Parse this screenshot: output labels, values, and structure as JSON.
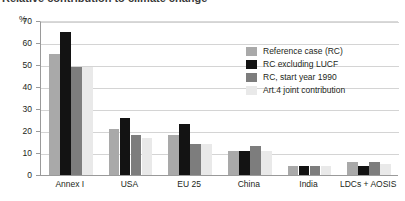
{
  "chart_data": {
    "type": "bar",
    "title": "Relative contribution to climate change",
    "ylabel": "%",
    "xlabel": "",
    "ylim": [
      0,
      70
    ],
    "yticks": [
      0,
      10,
      20,
      30,
      40,
      50,
      60,
      70
    ],
    "grid": true,
    "legend_position": "inside-top-right",
    "categories": [
      "Annex I",
      "USA",
      "EU 25",
      "China",
      "India",
      "LDCs + AOSIS"
    ],
    "series": [
      {
        "name": "Reference case (RC)",
        "color": "#a9a9a9",
        "values": [
          55,
          21,
          18,
          11,
          4,
          6
        ]
      },
      {
        "name": "RC excluding LUCF",
        "color": "#131313",
        "values": [
          65,
          26,
          23,
          11,
          4,
          4
        ]
      },
      {
        "name": "RC, start year 1990",
        "color": "#7d7d7d",
        "values": [
          49,
          18,
          14,
          13,
          4,
          6
        ]
      },
      {
        "name": "Art.4 joint contribution",
        "color": "#e9e9e9",
        "values": [
          49,
          17,
          14,
          11,
          4,
          5
        ]
      }
    ]
  },
  "colors": {
    "reference_case": "#a9a9a9",
    "rc_excluding_lucf": "#131313",
    "rc_start_year_1990": "#7d7d7d",
    "art4_joint": "#e9e9e9",
    "gridline": "#d4d4d4",
    "axis": "#9a9a9a",
    "text": "#231f20"
  }
}
